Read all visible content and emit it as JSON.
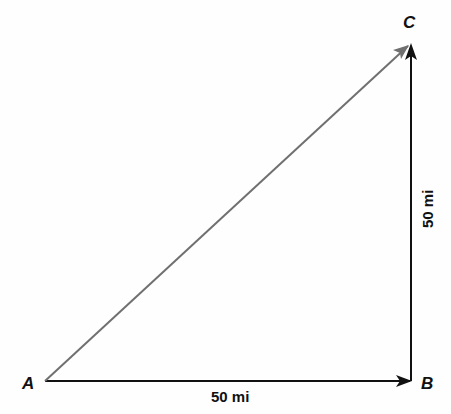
{
  "diagram": {
    "points": [
      {
        "name": "A",
        "x": 45,
        "y": 381
      },
      {
        "name": "B",
        "x": 412,
        "y": 381
      },
      {
        "name": "C",
        "x": 410,
        "y": 44
      }
    ],
    "labels": {
      "a": "A",
      "b": "B",
      "c": "C",
      "ab_distance": "50 mi",
      "bc_distance": "50 mi"
    },
    "colors": {
      "legs": "#111111",
      "resultant": "#707070",
      "background": "#fefefe"
    }
  }
}
